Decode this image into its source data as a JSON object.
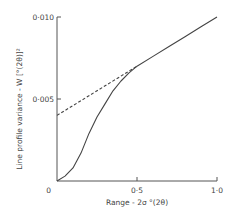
{
  "chart_data": {
    "type": "line",
    "title": "",
    "xlabel": "Range - 2σ °(2θ)",
    "ylabel": "Line profile variance - W [°(2θ)]²",
    "xlim": [
      0,
      1.0
    ],
    "ylim": [
      0,
      0.01
    ],
    "grid": false,
    "legend": null,
    "x_ticks": [
      "0",
      "0·5",
      "1·0"
    ],
    "y_ticks": [
      "0",
      "0·005",
      "0·010"
    ],
    "series": [
      {
        "name": "measured variance",
        "style": "solid",
        "x": [
          0.0,
          0.05,
          0.1,
          0.15,
          0.2,
          0.25,
          0.3,
          0.35,
          0.4,
          0.45,
          0.5,
          0.6,
          0.7,
          0.8,
          0.9,
          1.0
        ],
        "y": [
          0.0,
          0.0003,
          0.0008,
          0.0017,
          0.0029,
          0.0039,
          0.0047,
          0.0055,
          0.0061,
          0.0066,
          0.007,
          0.0076,
          0.0082,
          0.0088,
          0.0094,
          0.01
        ]
      },
      {
        "name": "linear extrapolation",
        "style": "dashed",
        "x": [
          0.0,
          0.5
        ],
        "y": [
          0.004,
          0.007
        ]
      }
    ],
    "annotations": []
  }
}
